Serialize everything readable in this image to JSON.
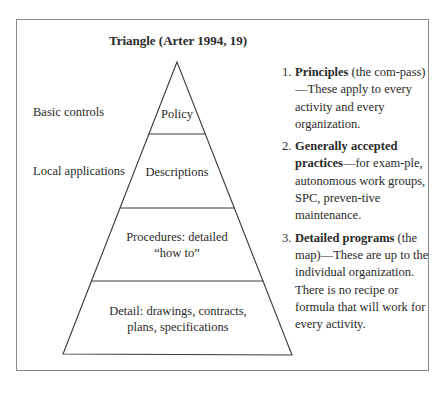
{
  "title": "Triangle (Arter 1994, 19)",
  "side_labels": [
    {
      "text": "Basic controls"
    },
    {
      "text": "Local applications"
    }
  ],
  "tiers": [
    {
      "label_line1": "Policy",
      "label_line2": ""
    },
    {
      "label_line1": "Descriptions",
      "label_line2": ""
    },
    {
      "label_line1": "Procedures: detailed",
      "label_line2": "“how to”"
    },
    {
      "label_line1": "Detail: drawings, contracts,",
      "label_line2": "plans, specifications"
    }
  ],
  "list": [
    {
      "num": "1.",
      "bold": "Principles",
      "rest": " (the com-pass)—These apply to every activity and every organization."
    },
    {
      "num": "2.",
      "bold": "Generally accepted practices",
      "rest": "—for exam-ple, autonomous work groups, SPC, preven-tive maintenance."
    },
    {
      "num": "3.",
      "bold": "Detailed programs",
      "rest": " (the map)—These are up to the individual organization. There is no recipe or formula that will work for every activity."
    }
  ],
  "colors": {
    "frame": "#8a8a8a",
    "line": "#3a3a3a",
    "text": "#2a2a2a"
  }
}
